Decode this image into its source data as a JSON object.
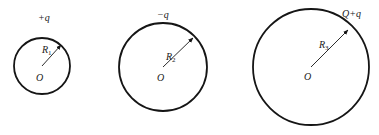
{
  "diagram": {
    "type": "three concentric-style charged spherical shells",
    "stroke_color": "#151515",
    "shells": [
      {
        "id": "shell-1",
        "center": [
          42,
          66
        ],
        "radius": 28,
        "charge_label": "+q",
        "radius_label": "R",
        "radius_subscript": "1",
        "center_label": "O",
        "charge_label_pos": [
          38,
          21
        ],
        "radius_label_pos": [
          42,
          53
        ],
        "center_label_pos": [
          37,
          81
        ],
        "arrow_end": [
          61,
          45
        ]
      },
      {
        "id": "shell-2",
        "center": [
          163,
          67
        ],
        "radius": 44,
        "charge_label": "−q",
        "radius_label": "R",
        "radius_subscript": "2",
        "center_label": "O",
        "charge_label_pos": [
          157,
          18
        ],
        "radius_label_pos": [
          167,
          60
        ],
        "center_label_pos": [
          157,
          81
        ],
        "arrow_end": [
          194,
          37
        ]
      },
      {
        "id": "shell-3",
        "center": [
          311,
          67
        ],
        "radius": 58,
        "charge_label": "Q+q",
        "radius_label": "R",
        "radius_subscript": "3",
        "center_label": "O",
        "charge_label_pos": [
          342,
          17
        ],
        "radius_label_pos": [
          319,
          48
        ],
        "center_label_pos": [
          304,
          80
        ],
        "arrow_end": [
          348,
          30
        ]
      }
    ]
  }
}
